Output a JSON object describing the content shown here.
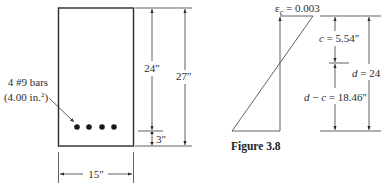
{
  "beam_section": {
    "width_label": "15″",
    "effective_depth_label": "24″",
    "total_depth_label": "27″",
    "cover_label": "3″",
    "rebar_label_line1": "4 #9 bars",
    "rebar_label_line2_prefix": "(4.00 in.",
    "rebar_label_line2_sup": "2",
    "rebar_label_line2_suffix": ")",
    "rebar_count": 4
  },
  "strain_diagram": {
    "strain_symbol": "ε",
    "strain_subscript": "c",
    "strain_value": " = 0.003",
    "c_label": "c = 5.54″",
    "d_minus_c_label": "d − c = 18.46″",
    "d_label": "d = 24"
  },
  "caption": {
    "text": "Figure 3.8"
  }
}
